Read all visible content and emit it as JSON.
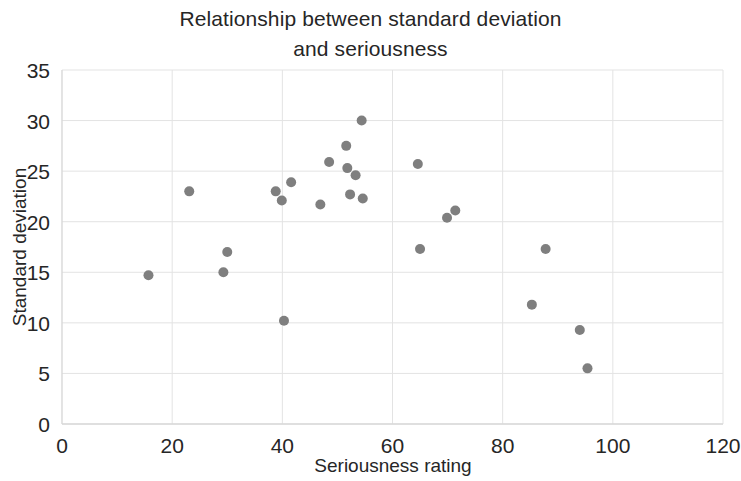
{
  "chart_data": {
    "type": "scatter",
    "title_line1": "Relationship between standard deviation",
    "title_line2": "and seriousness",
    "xlabel": "Seriousness rating",
    "ylabel": "Standard deviation",
    "xlim": [
      0,
      120
    ],
    "ylim": [
      0,
      35
    ],
    "xticks": [
      0,
      20,
      40,
      60,
      80,
      100,
      120
    ],
    "yticks": [
      0,
      5,
      10,
      15,
      20,
      25,
      30,
      35
    ],
    "xtick_labels": [
      "0",
      "20",
      "40",
      "60",
      "80",
      "100",
      "120"
    ],
    "ytick_labels": [
      "0",
      "5",
      "10",
      "15",
      "20",
      "25",
      "30",
      "35"
    ],
    "grid": true,
    "legend": false,
    "marker_color": "#7f7f7f",
    "marker_size": 9,
    "series": [
      {
        "name": "observations",
        "points": [
          [
            15.7,
            14.7
          ],
          [
            23.1,
            23.0
          ],
          [
            29.3,
            15.0
          ],
          [
            30.0,
            17.0
          ],
          [
            38.8,
            23.0
          ],
          [
            39.9,
            22.1
          ],
          [
            40.3,
            10.2
          ],
          [
            41.6,
            23.9
          ],
          [
            46.9,
            21.7
          ],
          [
            48.5,
            25.9
          ],
          [
            51.6,
            27.5
          ],
          [
            51.8,
            25.3
          ],
          [
            52.3,
            22.7
          ],
          [
            53.3,
            24.6
          ],
          [
            54.4,
            30.0
          ],
          [
            54.6,
            22.3
          ],
          [
            64.6,
            25.7
          ],
          [
            65.0,
            17.3
          ],
          [
            69.9,
            20.4
          ],
          [
            71.4,
            21.1
          ],
          [
            85.3,
            11.8
          ],
          [
            87.8,
            17.3
          ],
          [
            94.0,
            9.3
          ],
          [
            95.4,
            5.5
          ]
        ]
      }
    ]
  }
}
